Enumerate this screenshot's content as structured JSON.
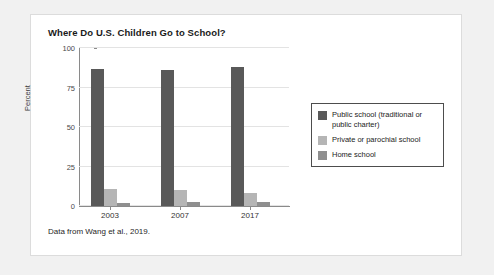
{
  "figure": {
    "caption": "Data from Wang et al., 2019."
  },
  "colors": {
    "series_public": "#595959",
    "series_private": "#b5b5b5",
    "series_home": "#8f8f8f",
    "gridline": "#e3e3e3",
    "axis": "#8a8a8a",
    "card_background": "#ffffff",
    "page_background": "#f1f1f1",
    "legend_border": "#4d4d4d"
  },
  "chart_data": {
    "type": "bar",
    "title": "Where Do U.S. Children Go to School?",
    "xlabel": "",
    "ylabel": "Percent",
    "categories": [
      "2003",
      "2007",
      "2017"
    ],
    "series": [
      {
        "name": "Public school (traditional or public charter)",
        "values": [
          87,
          86,
          88
        ],
        "color": "#595959"
      },
      {
        "name": "Private or parochial school",
        "values": [
          11,
          10,
          8
        ],
        "color": "#b5b5b5"
      },
      {
        "name": "Home school",
        "values": [
          2,
          2.5,
          2.5
        ],
        "color": "#8f8f8f"
      }
    ],
    "ylim": [
      0,
      100
    ],
    "yticks": [
      0,
      25,
      50,
      75,
      100
    ],
    "ytick_labels": [
      "0",
      "25",
      "50",
      "75",
      "100"
    ],
    "grid": true,
    "legend_position": "right"
  }
}
